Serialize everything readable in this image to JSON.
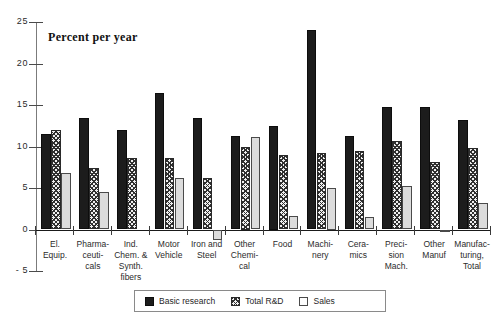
{
  "chart_data": {
    "type": "bar",
    "title": "Percent per year",
    "xlabel": "",
    "ylabel": "",
    "ylim": [
      -5,
      25
    ],
    "yticks": [
      25,
      20,
      15,
      10,
      5,
      0,
      -5
    ],
    "ytick_labels": [
      "25",
      "20",
      "15",
      "10",
      "5",
      "0",
      "- 5"
    ],
    "grid": false,
    "legend_position": "bottom-center",
    "categories": [
      "El.\nEquip.",
      "Pharma-\nceuti-\ncals",
      "Ind.\nChem. &\nSynth.\nfibers",
      "Motor\nVehicle",
      "Iron and\nSteel",
      "Other\nChemi-\ncal",
      "Food",
      "Machi-\nnery",
      "Cera-\nmics",
      "Preci-\nsion\nMach.",
      "Other\nManuf",
      "Manufac-\nturing,\nTotal"
    ],
    "series": [
      {
        "name": "Basic research",
        "color": "#1c1c1c",
        "pattern": "solid",
        "values": [
          11.5,
          13.4,
          12.0,
          16.5,
          13.4,
          11.3,
          12.5,
          24.0,
          11.3,
          14.8,
          14.8,
          13.2
        ]
      },
      {
        "name": "Total R&D",
        "color": "#2f2f2f",
        "pattern": "crosshatch",
        "values": [
          12.0,
          7.4,
          8.6,
          8.6,
          6.2,
          10.0,
          9.0,
          9.2,
          9.4,
          10.7,
          8.1,
          9.8
        ]
      },
      {
        "name": "Sales",
        "color": "#dcdcdc",
        "pattern": "light",
        "values": [
          6.8,
          4.5,
          null,
          6.2,
          -1.3,
          11.2,
          1.6,
          5.0,
          1.5,
          5.2,
          -0.35,
          3.2
        ]
      }
    ]
  },
  "legend": {
    "items": [
      {
        "label": "Basic research",
        "swatch": "basic"
      },
      {
        "label": "Total R&D",
        "swatch": "rd"
      },
      {
        "label": "Sales",
        "swatch": "sales"
      }
    ]
  }
}
